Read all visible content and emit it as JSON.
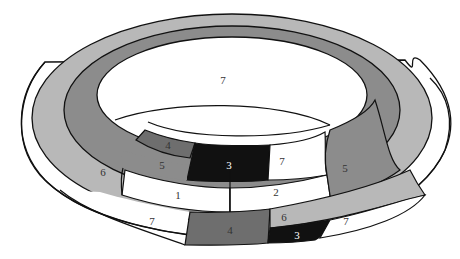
{
  "diagram": {
    "title": "",
    "colors": {
      "white": "#ffffff",
      "light_gray": "#b8b8b8",
      "mid_gray": "#8c8c8c",
      "dark_gray": "#6e6e6e",
      "black": "#111111",
      "outline": "#111111"
    },
    "regions": [
      {
        "id": "r7_top",
        "label": "7",
        "color": "white"
      },
      {
        "id": "r4_back",
        "label": "4",
        "color": "dark_gray"
      },
      {
        "id": "r5_left",
        "label": "5",
        "color": "mid_gray"
      },
      {
        "id": "r3_center",
        "label": "3",
        "color": "black"
      },
      {
        "id": "r7_mid",
        "label": "7",
        "color": "white"
      },
      {
        "id": "r6_left",
        "label": "6",
        "color": "light_gray"
      },
      {
        "id": "r1",
        "label": "1",
        "color": "white"
      },
      {
        "id": "r2",
        "label": "2",
        "color": "white"
      },
      {
        "id": "r5_right",
        "label": "5",
        "color": "mid_gray"
      },
      {
        "id": "r7_left",
        "label": "7",
        "color": "white"
      },
      {
        "id": "r4_front",
        "label": "4",
        "color": "dark_gray"
      },
      {
        "id": "r6_right",
        "label": "6",
        "color": "light_gray"
      },
      {
        "id": "r3_front",
        "label": "3",
        "color": "black"
      },
      {
        "id": "r7_right",
        "label": "7",
        "color": "white"
      }
    ]
  }
}
